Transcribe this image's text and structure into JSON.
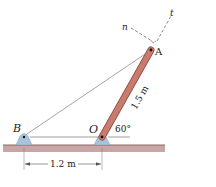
{
  "figure": {
    "points": {
      "A": "A",
      "B": "B",
      "O": "O"
    },
    "axes": {
      "n": "n",
      "t": "t"
    },
    "rod_length": "1.5 m",
    "angle": "60°",
    "span": "1.2 m",
    "colors": {
      "rod": "#c97b6e",
      "rod_edge": "#8a4a40",
      "support": "#a9c3d9",
      "ground": "#c9a5a5",
      "ground_edge": "#8c6b6b",
      "line": "#555555"
    }
  }
}
